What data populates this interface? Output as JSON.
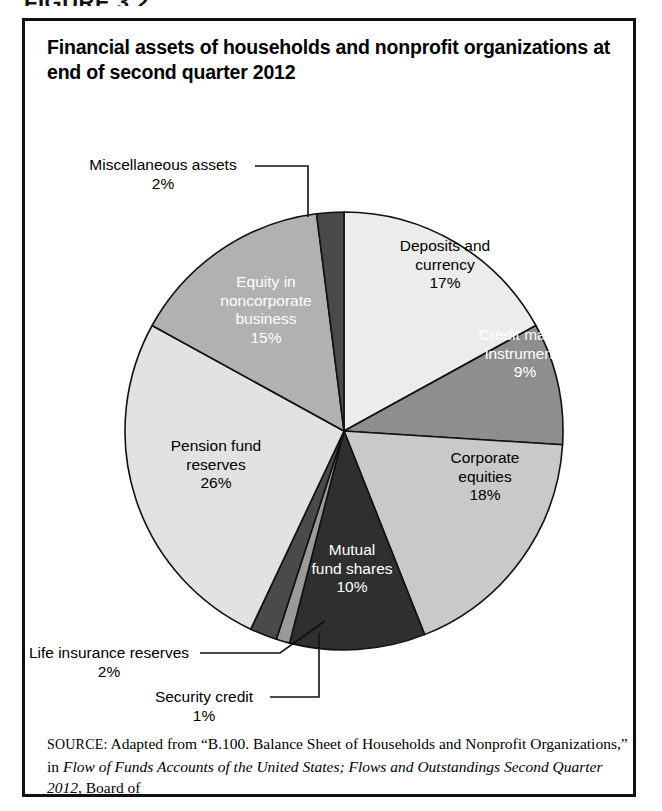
{
  "figure": {
    "label": "FIGURE 3.2",
    "title": "Financial assets of households and nonprofit organizations at end of second quarter 2012"
  },
  "source": {
    "kicker": "SOURCE:",
    "text_part1": " Adapted from “B.100. Balance Sheet of Households and Nonprofit Organizations,” in ",
    "italic1": "Flow of Funds Accounts of the United States; Flows and Outstandings Second Quarter 2012",
    "text_part2": ", Board of"
  },
  "chart_data": {
    "type": "pie",
    "title": "Financial assets of households and nonprofit organizations at end of second quarter 2012",
    "units": "percent of total financial assets",
    "total": 100,
    "categories": [
      "Deposits and currency",
      "Credit market instruments",
      "Corporate equities",
      "Mutual fund shares",
      "Security credit",
      "Life insurance reserves",
      "Pension fund reserves",
      "Equity in noncorporate business",
      "Miscellaneous assets"
    ],
    "values": [
      17,
      9,
      18,
      10,
      1,
      2,
      26,
      15,
      2
    ],
    "start_angle_deg": 0,
    "direction": "clockwise",
    "legend": "none (labels placed on slices and via leader lines)",
    "slices": [
      {
        "name": "Deposits and currency",
        "label_line1": "Deposits and",
        "label_line2": "currency",
        "value": 17,
        "value_label": "17%",
        "color": "#ececec",
        "text_color": "#000000",
        "label_placement": "inside"
      },
      {
        "name": "Credit market instruments",
        "label_line1": "Credit market",
        "label_line2": "instruments",
        "value": 9,
        "value_label": "9%",
        "color": "#8e8e8e",
        "text_color": "#ffffff",
        "label_placement": "inside"
      },
      {
        "name": "Corporate equities",
        "label_line1": "Corporate",
        "label_line2": "equities",
        "value": 18,
        "value_label": "18%",
        "color": "#c9c9c9",
        "text_color": "#000000",
        "label_placement": "inside"
      },
      {
        "name": "Mutual fund shares",
        "label_line1": "Mutual",
        "label_line2": "fund shares",
        "value": 10,
        "value_label": "10%",
        "color": "#2f2f2f",
        "text_color": "#ffffff",
        "label_placement": "inside"
      },
      {
        "name": "Security credit",
        "label_line1": "Security credit",
        "value": 1,
        "value_label": "1%",
        "color": "#9a9a9a",
        "text_color": "#000000",
        "label_placement": "callout"
      },
      {
        "name": "Life insurance reserves",
        "label_line1": "Life insurance reserves",
        "value": 2,
        "value_label": "2%",
        "color": "#4a4a4a",
        "text_color": "#000000",
        "label_placement": "callout"
      },
      {
        "name": "Pension fund reserves",
        "label_line1": "Pension fund",
        "label_line2": "reserves",
        "value": 26,
        "value_label": "26%",
        "color": "#e2e2e2",
        "text_color": "#000000",
        "label_placement": "inside"
      },
      {
        "name": "Equity in noncorporate business",
        "label_line1": "Equity in",
        "label_line2": "noncorporate",
        "label_line3": "business",
        "value": 15,
        "value_label": "15%",
        "color": "#b1b1b1",
        "text_color": "#ffffff",
        "label_placement": "inside"
      },
      {
        "name": "Miscellaneous assets",
        "label_line1": "Miscellaneous assets",
        "value": 2,
        "value_label": "2%",
        "color": "#4a4a4a",
        "text_color": "#000000",
        "label_placement": "callout"
      }
    ]
  }
}
